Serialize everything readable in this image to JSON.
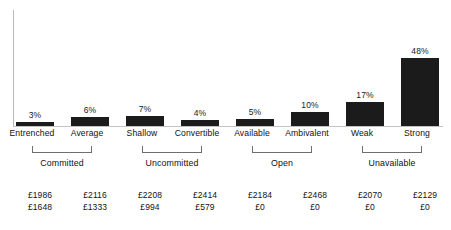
{
  "chart_data": {
    "type": "bar",
    "title": "",
    "subtitle": "",
    "xlabel": "",
    "ylabel": "",
    "ylim": [
      0,
      50
    ],
    "grid": false,
    "legend": "none",
    "axis": {
      "y_visible": true,
      "x_visible": true,
      "y_ticks": []
    },
    "categories": [
      "Entrenched",
      "Average",
      "Shallow",
      "Convertible",
      "Available",
      "Ambivalent",
      "Weak",
      "Strong"
    ],
    "values": [
      3,
      6,
      7,
      4,
      5,
      10,
      17,
      48
    ],
    "value_labels": [
      "3%",
      "6%",
      "7%",
      "4%",
      "5%",
      "10%",
      "17%",
      "48%"
    ],
    "bar_color": "#1b1b1b",
    "groups": [
      {
        "label": "Committed",
        "categories": [
          "Entrenched",
          "Average"
        ]
      },
      {
        "label": "Uncommitted",
        "categories": [
          "Shallow",
          "Convertible"
        ]
      },
      {
        "label": "Open",
        "categories": [
          "Available",
          "Ambivalent"
        ]
      },
      {
        "label": "Unavailable",
        "categories": [
          "Weak",
          "Strong"
        ]
      }
    ],
    "annotations": {
      "row1": [
        "£1986",
        "£2116",
        "£2208",
        "£2414",
        "£2184",
        "£2468",
        "£2070",
        "£2129"
      ],
      "row2": [
        "£1648",
        "£1333",
        "£994",
        "£579",
        "£0",
        "£0",
        "£0",
        "£0"
      ]
    }
  }
}
